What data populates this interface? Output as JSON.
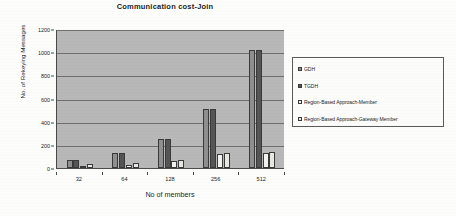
{
  "chart_data": {
    "type": "bar",
    "title": "Communication cost-Join",
    "xlabel": "No of members",
    "ylabel": "No. of Rekeying Messages",
    "categories": [
      "32",
      "64",
      "128",
      "256",
      "512"
    ],
    "ylim": [
      0,
      1200
    ],
    "yticks": [
      0,
      200,
      400,
      600,
      800,
      1000,
      1200
    ],
    "ytick_labels": [
      "0",
      "200",
      "400",
      "600",
      "800",
      "1000",
      "1200"
    ],
    "grid": true,
    "legend_position": "right",
    "series": [
      {
        "name": "GDH",
        "color": "#8f8f8f",
        "values": [
          65,
          128,
          250,
          508,
          1018
        ]
      },
      {
        "name": "TGDH",
        "color": "#555555",
        "values": [
          65,
          128,
          250,
          508,
          1018
        ]
      },
      {
        "name": "Region-Based Approach-Member",
        "color": "#f2f2ee",
        "values": [
          18,
          28,
          58,
          125,
          128
        ]
      },
      {
        "name": "Region-Based Approach-Gateway Member",
        "color": "#e8e8e2",
        "values": [
          32,
          40,
          65,
          130,
          140
        ]
      }
    ]
  },
  "legend": {
    "entries": [
      "GDH",
      "TGDH",
      "Region-Based Approach-Member",
      "Region-Based Approach-Gateway Member"
    ]
  }
}
